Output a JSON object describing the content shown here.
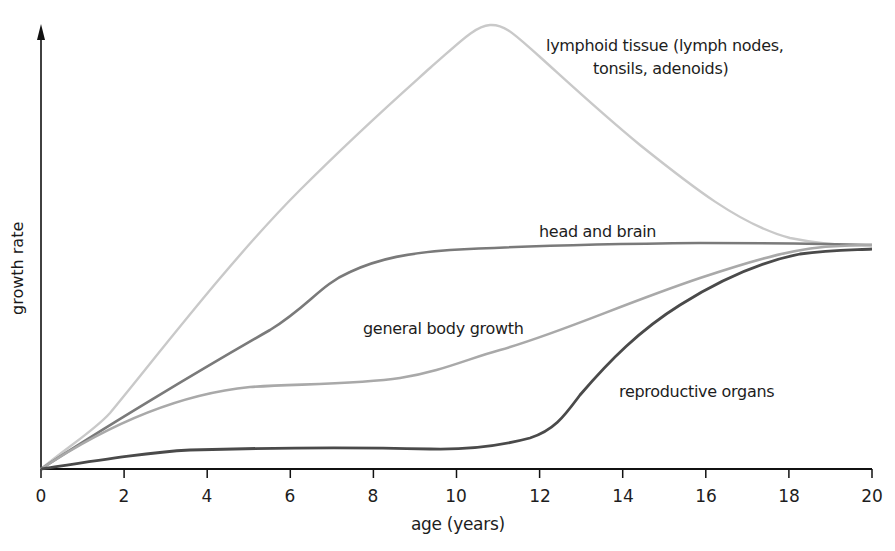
{
  "chart_data": {
    "type": "line",
    "title": "",
    "xlabel": "age (years)",
    "ylabel": "growth rate",
    "xlim": [
      0,
      20
    ],
    "ylim": [
      0,
      105
    ],
    "grid": false,
    "legend": "inline labels",
    "x_ticks": [
      0,
      2,
      4,
      6,
      8,
      10,
      12,
      14,
      16,
      18,
      20
    ],
    "x": [
      0,
      2,
      4,
      6,
      8,
      10,
      11,
      12,
      14,
      16,
      18,
      20
    ],
    "series": [
      {
        "name": "lymphoid tissue (lymph nodes, tonsils, adenoids)",
        "label_line1": "lymphoid tissue (lymph nodes,",
        "label_line2": "tonsils, adenoids)",
        "color": "#c8c8c8",
        "values": [
          0,
          20,
          44,
          68,
          93,
          114,
          118,
          112,
          86,
          68,
          59,
          57
        ]
      },
      {
        "name": "head and brain",
        "color": "#7a7a7a",
        "values": [
          0,
          19,
          36,
          52,
          66,
          70,
          71,
          71,
          72,
          72,
          72,
          72
        ]
      },
      {
        "name": "general body growth",
        "color": "#a8a8a8",
        "values": [
          0,
          12,
          18,
          20,
          21,
          25,
          28,
          31,
          40,
          53,
          66,
          72
        ]
      },
      {
        "name": "reproductive organs",
        "color": "#4a4a4a",
        "values": [
          0,
          3,
          4,
          5,
          5,
          5,
          6,
          10,
          30,
          51,
          63,
          71
        ]
      }
    ]
  },
  "axes": {
    "x_label": "age (years)",
    "y_label": "growth rate",
    "tick_labels": [
      "0",
      "2",
      "4",
      "6",
      "8",
      "10",
      "12",
      "14",
      "16",
      "18",
      "20"
    ]
  },
  "labels": {
    "lymphoid_1": "lymphoid tissue (lymph nodes,",
    "lymphoid_2": "tonsils, adenoids)",
    "head": "head and brain",
    "general": "general body growth",
    "reproductive": "reproductive organs"
  }
}
